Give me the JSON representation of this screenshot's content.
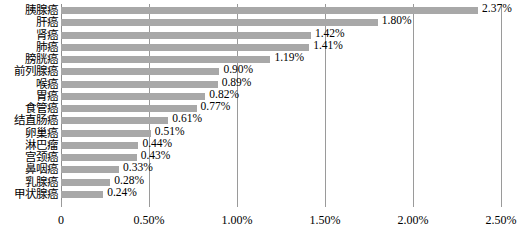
{
  "chart_data": {
    "type": "bar",
    "orientation": "horizontal",
    "title": "",
    "subtitle": "",
    "xlabel": "",
    "ylabel": "",
    "xlim": [
      0,
      2.5
    ],
    "xtick_labels": [
      "0",
      "0.50%",
      "1.00%",
      "1.50%",
      "2.00%",
      "2.50%"
    ],
    "xtick_values": [
      0,
      0.5,
      1.0,
      1.5,
      2.0,
      2.5
    ],
    "grid": "vertical",
    "legend": "none",
    "value_suffix": "%",
    "bar_color": "#a8a8a8",
    "gridline_color": "#9a9a9a",
    "text_color": "#000000",
    "categories": [
      "胰腺癌",
      "肝癌",
      "肾癌",
      "肺癌",
      "膀胱癌",
      "前列腺癌",
      "喉癌",
      "胃癌",
      "食管癌",
      "结直肠癌",
      "卵巢癌",
      "淋巴瘤",
      "宫颈癌",
      "鼻咽癌",
      "乳腺癌",
      "甲状腺癌"
    ],
    "values": [
      2.37,
      1.8,
      1.42,
      1.41,
      1.19,
      0.9,
      0.89,
      0.82,
      0.77,
      0.61,
      0.51,
      0.44,
      0.43,
      0.33,
      0.28,
      0.24
    ],
    "value_labels": [
      "2.37%",
      "1.80%",
      "1.42%",
      "1.41%",
      "1.19%",
      "0.90%",
      "0.89%",
      "0.82%",
      "0.77%",
      "0.61%",
      "0.51%",
      "0.44%",
      "0.43%",
      "0.33%",
      "0.28%",
      "0.24%"
    ]
  }
}
